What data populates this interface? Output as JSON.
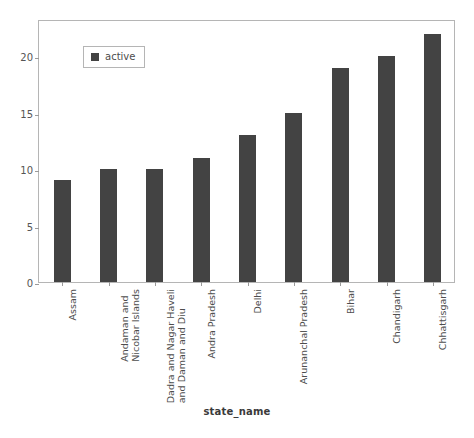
{
  "chart_data": {
    "type": "bar",
    "title": "",
    "xlabel": "state_name",
    "ylabel": "",
    "categories": [
      "Assam",
      "Andaman and Nicobar Islands",
      "Dadra and Nagar Haveli and Daman and Diu",
      "Andra Pradesh",
      "Delhi",
      "Arunanchal Pradesh",
      "Bihar",
      "Chandigarh",
      "Chhattisgarh"
    ],
    "category_lines": [
      [
        "Assam"
      ],
      [
        "Andaman and",
        "Nicobar Islands"
      ],
      [
        "Dadra and Nagar Haveli",
        "and Daman and Diu"
      ],
      [
        "Andra Pradesh"
      ],
      [
        "Delhi"
      ],
      [
        "Arunanchal Pradesh"
      ],
      [
        "Bihar"
      ],
      [
        "Chandigarh"
      ],
      [
        "Chhattisgarh"
      ]
    ],
    "series": [
      {
        "name": "active",
        "color": "#434343",
        "values": [
          9,
          10,
          10,
          11,
          13,
          15,
          19,
          20,
          22
        ]
      }
    ],
    "ylim": [
      0,
      23.3
    ],
    "yticks": [
      0,
      5,
      10,
      15,
      20
    ],
    "ytick_labels": [
      "0",
      "5",
      "10",
      "15",
      "20"
    ],
    "grid": false,
    "legend_position": "upper-left",
    "bar_color": "#434343",
    "frame_color": "#b5b5b5",
    "text_color": "#4d4d4d"
  },
  "legend": {
    "entries": [
      {
        "label": "active",
        "color": "#434343"
      }
    ]
  },
  "axis": {
    "x_title": "state_name"
  }
}
